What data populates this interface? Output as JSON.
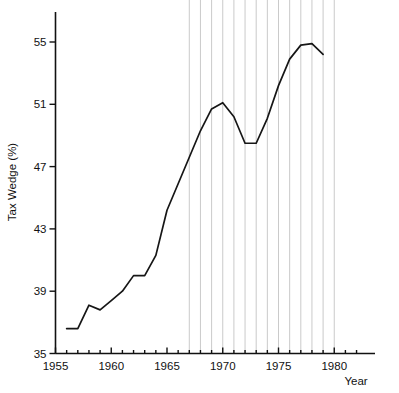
{
  "chart_data": {
    "type": "line",
    "title": "",
    "xlabel": "Year",
    "ylabel": "Tax Wedge (%)",
    "xlim": [
      1955,
      1983.7
    ],
    "ylim": [
      35,
      56.1
    ],
    "xticks": [
      1955,
      1960,
      1965,
      1970,
      1975,
      1980
    ],
    "xtick_labels": [
      "1955",
      "1960",
      "1965",
      "1970",
      "1975",
      "1980"
    ],
    "xminorticks": [
      1956,
      1957,
      1958,
      1959,
      1961,
      1962,
      1963,
      1964,
      1966,
      1967,
      1968,
      1969,
      1971,
      1972,
      1973,
      1974,
      1976,
      1977,
      1978,
      1979,
      1981,
      1982
    ],
    "yticks": [
      35,
      39,
      43,
      47,
      51,
      55
    ],
    "ytick_labels": [
      "35",
      "39",
      "43",
      "47",
      "51",
      "55"
    ],
    "grid": "vertical-only",
    "gridline_years": [
      1967,
      1968,
      1969,
      1970,
      1971,
      1972,
      1973,
      1974,
      1975,
      1976,
      1977,
      1978,
      1979,
      1980
    ],
    "legend": "none",
    "series": [
      {
        "name": "Tax Wedge",
        "x": [
          1956,
          1957,
          1958,
          1959,
          1960,
          1961,
          1962,
          1963,
          1964,
          1965,
          1966,
          1967,
          1968,
          1969,
          1970,
          1971,
          1972,
          1973,
          1974,
          1975,
          1976,
          1977,
          1978,
          1979
        ],
        "values": [
          36.6,
          36.6,
          38.1,
          37.8,
          38.4,
          39.0,
          40.0,
          40.0,
          41.3,
          44.2,
          45.9,
          47.6,
          49.3,
          50.7,
          51.1,
          50.2,
          48.5,
          48.5,
          50.1,
          52.2,
          53.9,
          54.8,
          54.9,
          54.2
        ]
      }
    ]
  },
  "axes": {
    "y_axis_label": "Tax Wedge (%)",
    "x_axis_label": "Year"
  }
}
